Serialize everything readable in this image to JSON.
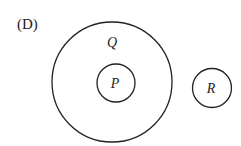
{
  "option_label": "(D)",
  "sets": {
    "outer": {
      "label": "Q"
    },
    "inner": {
      "label": "P"
    },
    "separate": {
      "label": "R"
    }
  },
  "colors": {
    "stroke": "#222222",
    "background": "#ffffff"
  }
}
